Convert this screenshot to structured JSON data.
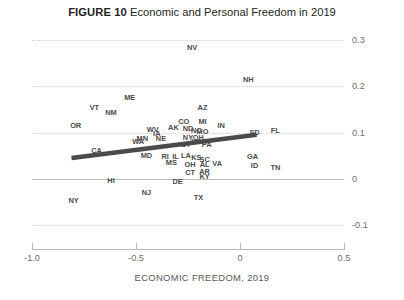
{
  "figure": {
    "number_label": "FIGURE 10",
    "title": "Economic and Personal Freedom in 2019"
  },
  "chart_data": {
    "type": "scatter",
    "title": "Economic and Personal Freedom in 2019",
    "xlabel": "ECONOMIC FREEDOM, 2019",
    "ylabel": "",
    "xlim": [
      -1.15,
      0.6
    ],
    "ylim": [
      -0.12,
      0.32
    ],
    "xticks": [
      "-1.0",
      "-0.5",
      "0",
      "0.5"
    ],
    "xtick_values": [
      -1.0,
      -0.5,
      0,
      0.5
    ],
    "yticks": [
      "0.3",
      "0.2",
      "0.1",
      "0",
      "-0.1"
    ],
    "ytick_values": [
      0.3,
      0.2,
      0.1,
      0,
      -0.1
    ],
    "grid": true,
    "legend": "none",
    "point_label_style": "state-abbreviation",
    "points": [
      {
        "label": "NV",
        "x": -0.23,
        "y": 0.283
      },
      {
        "label": "NH",
        "x": 0.04,
        "y": 0.213
      },
      {
        "label": "ME",
        "x": -0.53,
        "y": 0.174
      },
      {
        "label": "VT",
        "x": -0.7,
        "y": 0.154
      },
      {
        "label": "NM",
        "x": -0.62,
        "y": 0.143
      },
      {
        "label": "AZ",
        "x": -0.18,
        "y": 0.152
      },
      {
        "label": "OR",
        "x": -0.79,
        "y": 0.115
      },
      {
        "label": "CO",
        "x": -0.27,
        "y": 0.122
      },
      {
        "label": "MI",
        "x": -0.18,
        "y": 0.122
      },
      {
        "label": "IN",
        "x": -0.09,
        "y": 0.113
      },
      {
        "label": "WV",
        "x": -0.42,
        "y": 0.105
      },
      {
        "label": "AK",
        "x": -0.32,
        "y": 0.109
      },
      {
        "label": "ND",
        "x": -0.25,
        "y": 0.107
      },
      {
        "label": "NC",
        "x": -0.21,
        "y": 0.103
      },
      {
        "label": "MO",
        "x": -0.18,
        "y": 0.101
      },
      {
        "label": "SD",
        "x": 0.07,
        "y": 0.098
      },
      {
        "label": "FL",
        "x": 0.17,
        "y": 0.104
      },
      {
        "label": "MN",
        "x": -0.47,
        "y": 0.086
      },
      {
        "label": "NE",
        "x": -0.38,
        "y": 0.085
      },
      {
        "label": "IA",
        "x": -0.4,
        "y": 0.097
      },
      {
        "label": "NY",
        "x": -0.25,
        "y": 0.088
      },
      {
        "label": "OH",
        "x": -0.2,
        "y": 0.088
      },
      {
        "label": "WA",
        "x": -0.49,
        "y": 0.079
      },
      {
        "label": "WI",
        "x": -0.21,
        "y": 0.08
      },
      {
        "label": "UT",
        "x": -0.26,
        "y": 0.072
      },
      {
        "label": "PA",
        "x": -0.16,
        "y": 0.074
      },
      {
        "label": "CA",
        "x": -0.69,
        "y": 0.059
      },
      {
        "label": "MD",
        "x": -0.45,
        "y": 0.05
      },
      {
        "label": "RI",
        "x": -0.36,
        "y": 0.047
      },
      {
        "label": "IL",
        "x": -0.31,
        "y": 0.048
      },
      {
        "label": "LA",
        "x": -0.26,
        "y": 0.05
      },
      {
        "label": "KS",
        "x": -0.21,
        "y": 0.045
      },
      {
        "label": "SC",
        "x": -0.17,
        "y": 0.04
      },
      {
        "label": "GA",
        "x": 0.06,
        "y": 0.046
      },
      {
        "label": "MS",
        "x": -0.33,
        "y": 0.034
      },
      {
        "label": "OH2",
        "x": -0.24,
        "y": 0.03
      },
      {
        "label": "AL",
        "x": -0.17,
        "y": 0.029
      },
      {
        "label": "VA",
        "x": -0.11,
        "y": 0.031
      },
      {
        "label": "ID",
        "x": 0.07,
        "y": 0.028
      },
      {
        "label": "TN",
        "x": 0.17,
        "y": 0.024
      },
      {
        "label": "CT",
        "x": -0.24,
        "y": 0.013
      },
      {
        "label": "AR",
        "x": -0.17,
        "y": 0.014
      },
      {
        "label": "KY",
        "x": -0.17,
        "y": 0.004
      },
      {
        "label": "HI",
        "x": -0.62,
        "y": -0.004
      },
      {
        "label": "DE",
        "x": -0.3,
        "y": -0.007
      },
      {
        "label": "NJ",
        "x": -0.45,
        "y": -0.031
      },
      {
        "label": "TX",
        "x": -0.2,
        "y": -0.042
      },
      {
        "label": "NY2",
        "x": -0.8,
        "y": -0.049
      }
    ],
    "trendline": {
      "x_start": -0.81,
      "y_start": 0.045,
      "x_end": 0.08,
      "y_end": 0.095,
      "color": "#4a4a4a"
    }
  }
}
